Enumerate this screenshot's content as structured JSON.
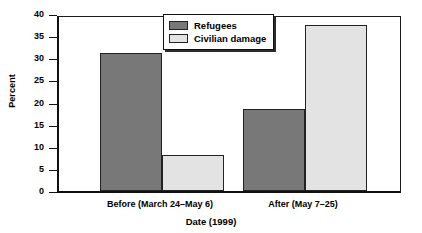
{
  "chart_data": {
    "type": "bar",
    "title": "",
    "xlabel": "Date (1999)",
    "ylabel": "Percent",
    "categories": [
      "Before (March 24–May 6)",
      "After (May 7–25)"
    ],
    "series": [
      {
        "name": "Refugees",
        "values": [
          31.2,
          18.5
        ],
        "color": "#787878"
      },
      {
        "name": "Civilian damage",
        "values": [
          8.2,
          37.5
        ],
        "color": "#e3e3e3"
      }
    ],
    "ylim": [
      0,
      40
    ],
    "yticks": [
      0,
      5,
      10,
      15,
      20,
      25,
      30,
      35,
      40
    ],
    "ytick_labels": [
      "0",
      "5",
      "10",
      "15",
      "20",
      "25",
      "30",
      "35",
      "40"
    ],
    "grid": false,
    "legend_position": "top-center"
  }
}
